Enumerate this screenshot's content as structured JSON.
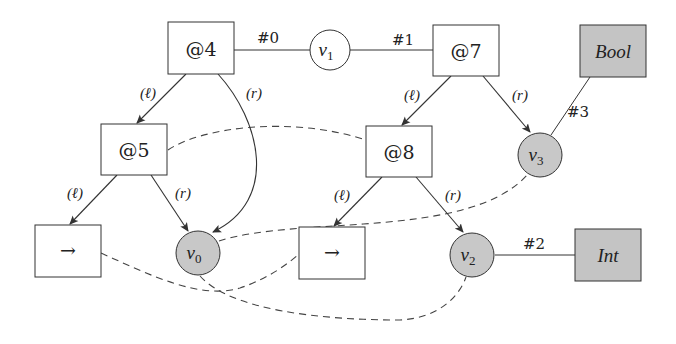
{
  "diagram": {
    "colors": {
      "line": "#333333",
      "shaded_fill": "#c8c8c8",
      "box_fill": "#ffffff"
    },
    "nodes": {
      "at4": {
        "label": "@4",
        "kind": "box"
      },
      "v1": {
        "label": "v",
        "sub": "1",
        "kind": "circle"
      },
      "at7": {
        "label": "@7",
        "kind": "box"
      },
      "bool": {
        "label": "Bool",
        "kind": "shaded-box"
      },
      "at5": {
        "label": "@5",
        "kind": "box"
      },
      "at8": {
        "label": "@8",
        "kind": "box"
      },
      "v3": {
        "label": "v",
        "sub": "3",
        "kind": "shaded-circle"
      },
      "arrow_left": {
        "label": "→",
        "kind": "box"
      },
      "v0": {
        "label": "v",
        "sub": "0",
        "kind": "shaded-circle"
      },
      "arrow_mid": {
        "label": "→",
        "kind": "box"
      },
      "v2": {
        "label": "v",
        "sub": "2",
        "kind": "shaded-circle"
      },
      "int": {
        "label": "Int",
        "kind": "shaded-box"
      }
    },
    "edge_labels": {
      "hash0": "#0",
      "hash1": "#1",
      "hash2": "#2",
      "hash3": "#3",
      "at4_left": "(ℓ)",
      "at4_right": "(r)",
      "at7_left": "(ℓ)",
      "at7_right": "(r)",
      "at5_left": "(ℓ)",
      "at5_right": "(r)",
      "at8_left": "(ℓ)",
      "at8_right": "(r)"
    },
    "edges": [
      {
        "from": "at4",
        "to": "v1",
        "label": "#0",
        "style": "solid"
      },
      {
        "from": "v1",
        "to": "at7",
        "label": "#1",
        "style": "solid"
      },
      {
        "from": "at4",
        "to": "at5",
        "label": "(ℓ)",
        "style": "arrow"
      },
      {
        "from": "at4",
        "to": "v0",
        "label": "(r)",
        "style": "arrow-curved"
      },
      {
        "from": "at7",
        "to": "at8",
        "label": "(ℓ)",
        "style": "arrow"
      },
      {
        "from": "at7",
        "to": "v3",
        "label": "(r)",
        "style": "arrow"
      },
      {
        "from": "bool",
        "to": "v3",
        "label": "#3",
        "style": "solid"
      },
      {
        "from": "at5",
        "to": "arrow_left",
        "label": "(ℓ)",
        "style": "arrow"
      },
      {
        "from": "at5",
        "to": "v0",
        "label": "(r)",
        "style": "arrow"
      },
      {
        "from": "at8",
        "to": "arrow_mid",
        "label": "(ℓ)",
        "style": "arrow"
      },
      {
        "from": "at8",
        "to": "v2",
        "label": "(r)",
        "style": "arrow"
      },
      {
        "from": "v2",
        "to": "int",
        "label": "#2",
        "style": "solid"
      },
      {
        "from": "at5",
        "to": "at8",
        "style": "dashed"
      },
      {
        "from": "v0",
        "to": "v3",
        "style": "dashed"
      },
      {
        "from": "arrow_left",
        "to": "arrow_mid",
        "style": "dashed"
      },
      {
        "from": "v0",
        "to": "v2",
        "style": "dashed"
      }
    ]
  }
}
